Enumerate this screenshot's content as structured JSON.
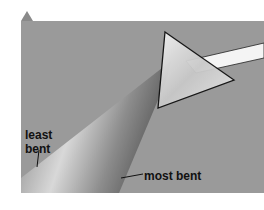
{
  "figure": {
    "marker": "triangle-marker",
    "labels": {
      "least": "least\nbent",
      "least_line1": "least",
      "least_line2": "bent",
      "most": "most bent"
    },
    "colors": {
      "background": "#9a9a9a",
      "beam_light": "#e8e8e8",
      "beam_dark": "#6e6e6e",
      "prism_outline": "#111111",
      "marker": "#8a8a8a"
    }
  }
}
